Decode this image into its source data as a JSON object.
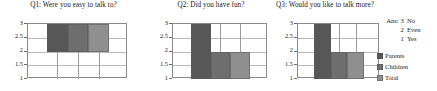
{
  "chart_data": {
    "type": "bar",
    "title": "",
    "subtitle": "",
    "xlabel": "",
    "ylabel": "",
    "ylim": [
      1,
      3
    ],
    "ytick_labels": [
      "3",
      "2.5",
      "2",
      "1.5",
      "1"
    ],
    "ytick_values": [
      3,
      2.5,
      2,
      1.5,
      1
    ],
    "grid": true,
    "legend_position": "right",
    "categories": [
      "Parents",
      "Children",
      "Total"
    ],
    "series_colors": [
      "#575757",
      "#6e6e6e",
      "#8f8f8f"
    ],
    "panels": [
      {
        "title": "Q1: Were you easy to talk to?",
        "bars": [
          {
            "name": "Parents",
            "box_low": 2,
            "box_high": 3,
            "whisker_low": 1,
            "whisker_high": 3
          },
          {
            "name": "Children",
            "box_low": 2,
            "box_high": 3,
            "whisker_low": 1,
            "whisker_high": 3
          },
          {
            "name": "Total",
            "box_low": 2,
            "box_high": 3,
            "whisker_low": 1,
            "whisker_high": 3
          }
        ]
      },
      {
        "title": "Q2: Did you have fun?",
        "bars": [
          {
            "name": "Parents",
            "box_low": 1,
            "box_high": 3,
            "whisker_low": 1,
            "whisker_high": 3
          },
          {
            "name": "Children",
            "box_low": 1,
            "box_high": 2,
            "whisker_low": 1,
            "whisker_high": 3
          },
          {
            "name": "Total",
            "box_low": 1,
            "box_high": 2,
            "whisker_low": 1,
            "whisker_high": 3
          }
        ]
      },
      {
        "title": "Q3: Would you like to talk more?",
        "bars": [
          {
            "name": "Parents",
            "box_low": 1,
            "box_high": 3,
            "whisker_low": 1,
            "whisker_high": 3
          },
          {
            "name": "Children",
            "box_low": 1,
            "box_high": 2,
            "whisker_low": 1,
            "whisker_high": 3
          },
          {
            "name": "Total",
            "box_low": 1,
            "box_high": 2,
            "whisker_low": 1,
            "whisker_high": 3
          }
        ]
      }
    ],
    "annotations": {
      "answer_key_label": "Ans:",
      "answer_key": [
        {
          "value": "3",
          "meaning": "No"
        },
        {
          "value": "2",
          "meaning": "Even"
        },
        {
          "value": "1",
          "meaning": "Yes"
        }
      ]
    },
    "legend": [
      {
        "label": "Parents",
        "color": "#575757"
      },
      {
        "label": "Children",
        "color": "#6e6e6e"
      },
      {
        "label": "Total",
        "color": "#8f8f8f"
      }
    ]
  }
}
